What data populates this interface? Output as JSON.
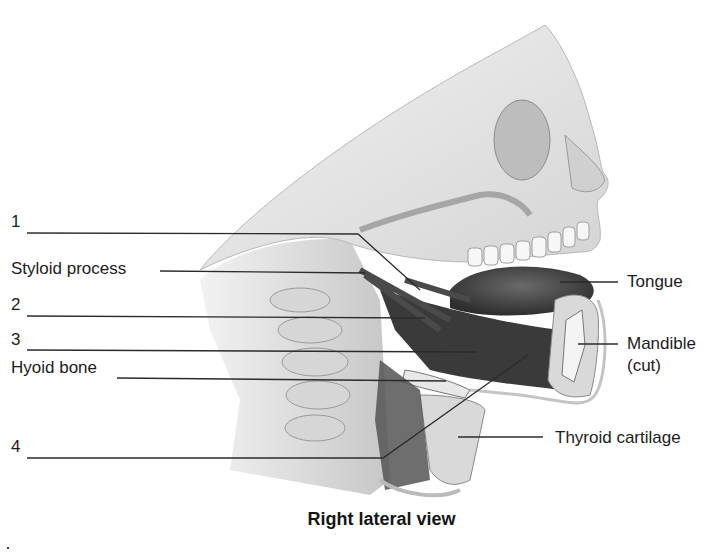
{
  "figure": {
    "caption": "Right lateral view",
    "labels_left": [
      {
        "id": "1",
        "text": "1",
        "y": 221
      },
      {
        "id": "styloid",
        "text": "Styloid process",
        "y": 268
      },
      {
        "id": "2",
        "text": "2",
        "y": 304
      },
      {
        "id": "3",
        "text": "3",
        "y": 340
      },
      {
        "id": "hyoid",
        "text": "Hyoid bone",
        "y": 368
      },
      {
        "id": "4",
        "text": "4",
        "y": 447
      }
    ],
    "labels_right": [
      {
        "id": "tongue",
        "text": "Tongue",
        "y": 283
      },
      {
        "id": "mandible",
        "text": "Mandible",
        "y": 343
      },
      {
        "id": "mandible_sub",
        "text": "(cut)",
        "y": 365
      },
      {
        "id": "thyroid",
        "text": "Thyroid cartilage",
        "y": 440
      }
    ],
    "colors": {
      "background": "#ffffff",
      "bone": "#e6e6e6",
      "bone_shade": "#c8c8c8",
      "muscle": "#3d3d3d",
      "tongue": "#4a4a4a",
      "leader_line": "#2b2b2b",
      "text": "#1c1c1c"
    }
  }
}
